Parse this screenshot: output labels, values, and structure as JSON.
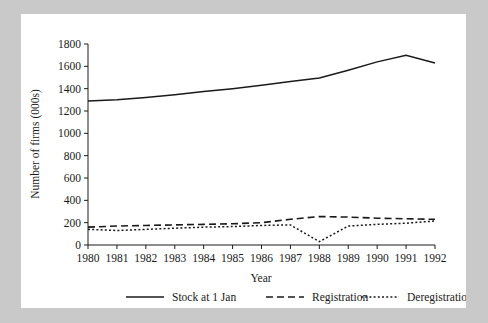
{
  "chart_data": {
    "type": "line",
    "title": "",
    "xlabel": "Year",
    "ylabel": "Number of firms (000s)",
    "x": [
      1980,
      1981,
      1982,
      1983,
      1984,
      1985,
      1986,
      1987,
      1988,
      1989,
      1990,
      1991,
      1992
    ],
    "xticklabels": [
      "1980",
      "1981",
      "1982",
      "1983",
      "1984",
      "1985",
      "1986",
      "1987",
      "1988",
      "1989",
      "1990",
      "1991",
      "1992"
    ],
    "yticklabels": [
      "0",
      "200",
      "400",
      "600",
      "800",
      "1000",
      "1200",
      "1400",
      "1600",
      "1800"
    ],
    "yticks": [
      0,
      200,
      400,
      600,
      800,
      1000,
      1200,
      1400,
      1600,
      1800
    ],
    "xlim": [
      1980,
      1992
    ],
    "ylim": [
      0,
      1800
    ],
    "grid": false,
    "legend_position": "bottom",
    "series": [
      {
        "name": "Stock at 1 Jan",
        "style": "solid",
        "values": [
          1290,
          1300,
          1320,
          1345,
          1375,
          1400,
          1430,
          1465,
          1495,
          1565,
          1640,
          1700,
          1630
        ]
      },
      {
        "name": "Registration",
        "style": "dashed",
        "values": [
          160,
          170,
          175,
          180,
          185,
          190,
          200,
          230,
          255,
          250,
          240,
          235,
          230
        ]
      },
      {
        "name": "Deregistration",
        "style": "dotted",
        "values": [
          140,
          130,
          140,
          150,
          160,
          165,
          175,
          180,
          30,
          170,
          185,
          195,
          215
        ]
      }
    ]
  },
  "legend": {
    "items": [
      {
        "label": "Stock at 1 Jan",
        "style": "solid"
      },
      {
        "label": "Registration",
        "style": "dashed"
      },
      {
        "label": "Deregistration",
        "style": "dotted"
      }
    ]
  }
}
